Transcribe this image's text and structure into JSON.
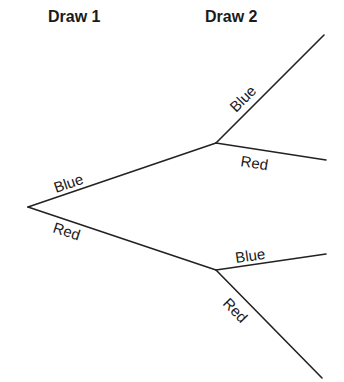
{
  "headers": {
    "draw1": "Draw 1",
    "draw2": "Draw 2"
  },
  "tree": {
    "first_draw": {
      "upper_label": "Blue",
      "lower_label": "Red"
    },
    "after_blue": {
      "upper_label": "Blue",
      "lower_label": "Red"
    },
    "after_red": {
      "upper_label": "Blue",
      "lower_label": "Red"
    }
  },
  "colors": {
    "line": "#222222",
    "text": "#1a1a1a",
    "background": "#ffffff"
  }
}
